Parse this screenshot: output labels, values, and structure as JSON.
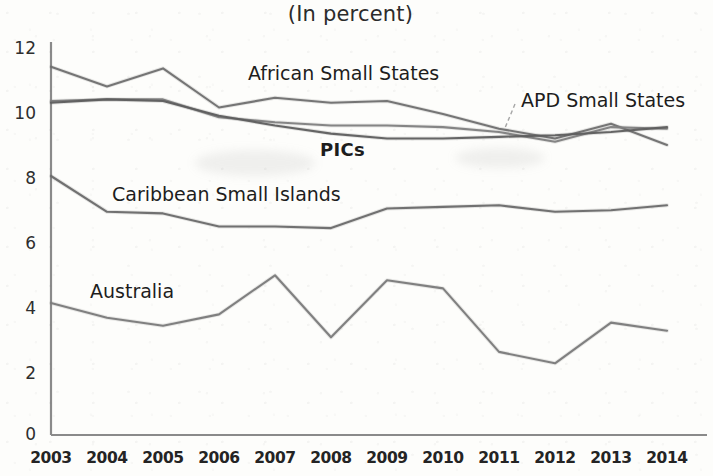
{
  "chart_data": {
    "type": "line",
    "title": "(In percent)",
    "xlabel": "",
    "ylabel": "",
    "x": [
      2003,
      2004,
      2005,
      2006,
      2007,
      2008,
      2009,
      2010,
      2011,
      2012,
      2013,
      2014
    ],
    "xtick_labels": [
      "2003",
      "2004",
      "2005",
      "2006",
      "2007",
      "2008",
      "2009",
      "2010",
      "2011",
      "2012",
      "2013",
      "2014"
    ],
    "ytick_labels": [
      "0",
      "2",
      "4",
      "6",
      "8",
      "10",
      "12"
    ],
    "yticks": [
      0,
      2,
      4,
      6,
      8,
      10,
      12
    ],
    "ylim": [
      0,
      12
    ],
    "xlim": [
      2003,
      2014
    ],
    "grid": false,
    "legend": "inline-labels",
    "series": [
      {
        "name": "African Small States",
        "label": "African Small States",
        "color": "#6f6f6f",
        "values": [
          11.3,
          10.7,
          11.25,
          10.05,
          10.35,
          10.2,
          10.25,
          9.85,
          9.4,
          9.1,
          9.55,
          8.9
        ]
      },
      {
        "name": "APD Small States",
        "label": "APD Small States",
        "color": "#808080",
        "values": [
          10.25,
          10.3,
          10.3,
          9.75,
          9.6,
          9.5,
          9.5,
          9.45,
          9.3,
          9.0,
          9.45,
          9.4
        ]
      },
      {
        "name": "PICs",
        "label": "PICs",
        "color": "#5e5e5e",
        "values": [
          10.2,
          10.3,
          10.25,
          9.8,
          9.5,
          9.25,
          9.1,
          9.1,
          9.15,
          9.2,
          9.3,
          9.45
        ]
      },
      {
        "name": "Caribbean Small Islands",
        "label": "Caribbean Small Islands",
        "color": "#6a6a6a",
        "values": [
          7.95,
          6.85,
          6.8,
          6.4,
          6.4,
          6.35,
          6.95,
          7.0,
          7.05,
          6.85,
          6.9,
          7.05
        ]
      },
      {
        "name": "Australia",
        "label": "Australia",
        "color": "#7a7a7a",
        "values": [
          4.05,
          3.6,
          3.35,
          3.7,
          4.9,
          3.0,
          4.75,
          4.5,
          2.55,
          2.2,
          3.45,
          3.2
        ]
      }
    ],
    "annotations": [
      {
        "name": "african-small-states-label",
        "text": "African Small States",
        "x": 248,
        "y": 62
      },
      {
        "name": "apd-small-states-label",
        "text": "APD Small States",
        "x": 521,
        "y": 89
      },
      {
        "name": "pics-label",
        "text": "PICs",
        "x": 320,
        "y": 139
      },
      {
        "name": "caribbean-small-islands-label",
        "text": "Caribbean Small Islands",
        "x": 112,
        "y": 183
      },
      {
        "name": "australia-label",
        "text": "Australia",
        "x": 90,
        "y": 280
      }
    ]
  }
}
